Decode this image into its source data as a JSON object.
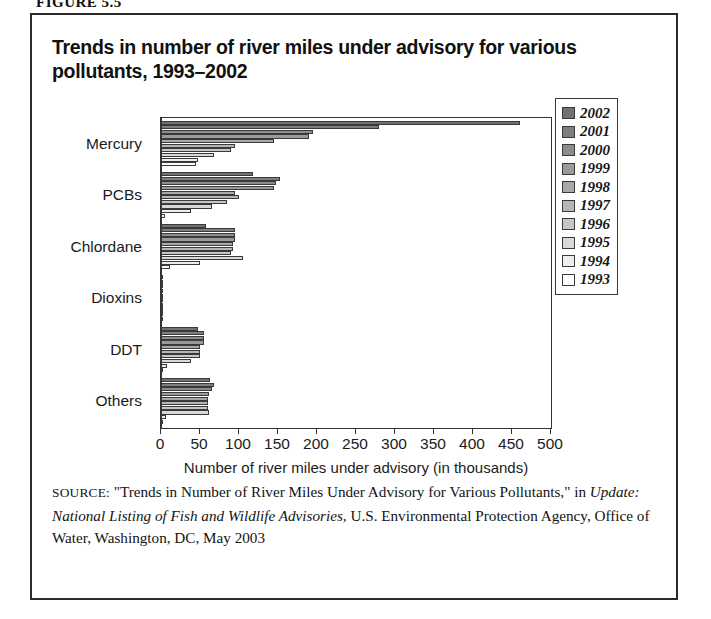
{
  "figure": {
    "label": "FIGURE 5.5"
  },
  "title": "Trends in number of river miles under advisory for various pollutants, 1993–2002",
  "legend": {
    "position": "right-inside",
    "entries": [
      {
        "year": "2002",
        "color": "#717171"
      },
      {
        "year": "2001",
        "color": "#7e7e7e"
      },
      {
        "year": "2000",
        "color": "#8c8c8c"
      },
      {
        "year": "1999",
        "color": "#9a9a9a"
      },
      {
        "year": "1998",
        "color": "#a8a8a8"
      },
      {
        "year": "1997",
        "color": "#b6b6b6"
      },
      {
        "year": "1996",
        "color": "#c6c6c6"
      },
      {
        "year": "1995",
        "color": "#d8d8d8"
      },
      {
        "year": "1994",
        "color": "#ededed"
      },
      {
        "year": "1993",
        "color": "#ffffff"
      }
    ]
  },
  "source": {
    "prefix": "SOURCE:",
    "line1": " \"Trends in Number of River Miles Under Advisory for Various Pollutants,\" in ",
    "italic1": "Update: National Listing of Fish and Wildlife Advisories,",
    "line2": " U.S. Environmental Protection Agency, Office of Water, Washington, DC, May 2003"
  },
  "chart_data": {
    "type": "bar",
    "orientation": "horizontal",
    "title": "Trends in number of river miles under advisory for various pollutants, 1993–2002",
    "xlabel": "Number of river miles under advisory (in thousands)",
    "ylabel": "",
    "xlim": [
      0,
      500
    ],
    "xticks": [
      0,
      50,
      100,
      150,
      200,
      250,
      300,
      350,
      400,
      450,
      500
    ],
    "grid": false,
    "legend_position": "right-inside",
    "categories": [
      "Mercury",
      "PCBs",
      "Chlordane",
      "Dioxins",
      "DDT",
      "Others"
    ],
    "series": [
      {
        "name": "2002",
        "color": "#717171",
        "values": [
          460,
          118,
          58,
          3,
          48,
          63
        ]
      },
      {
        "name": "2001",
        "color": "#7e7e7e",
        "values": [
          280,
          152,
          95,
          3,
          55,
          68
        ]
      },
      {
        "name": "2000",
        "color": "#8c8c8c",
        "values": [
          195,
          148,
          95,
          3,
          55,
          65
        ]
      },
      {
        "name": "1999",
        "color": "#9a9a9a",
        "values": [
          190,
          145,
          95,
          2,
          55,
          62
        ]
      },
      {
        "name": "1998",
        "color": "#a8a8a8",
        "values": [
          145,
          95,
          92,
          2,
          50,
          60
        ]
      },
      {
        "name": "1997",
        "color": "#b6b6b6",
        "values": [
          95,
          100,
          92,
          2,
          50,
          60
        ]
      },
      {
        "name": "1996",
        "color": "#c6c6c6",
        "values": [
          90,
          85,
          90,
          2,
          50,
          60
        ]
      },
      {
        "name": "1995",
        "color": "#d8d8d8",
        "values": [
          68,
          65,
          105,
          2,
          38,
          62
        ]
      },
      {
        "name": "1994",
        "color": "#ededed",
        "values": [
          48,
          38,
          50,
          1,
          8,
          6
        ]
      },
      {
        "name": "1993",
        "color": "#ffffff",
        "values": [
          45,
          5,
          12,
          1,
          3,
          3
        ]
      }
    ]
  }
}
